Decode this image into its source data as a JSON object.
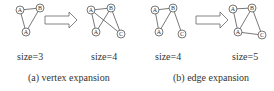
{
  "panels": [
    {
      "caption": "(a) vertex expansion",
      "before": {
        "size_label": "size=3",
        "nodes": [
          {
            "id": "a1",
            "label": "A",
            "x": 20,
            "y": 10
          },
          {
            "id": "b1",
            "label": "B",
            "x": 40,
            "y": 8
          },
          {
            "id": "a2",
            "label": "A",
            "x": 26,
            "y": 32
          }
        ],
        "edges": [
          [
            "a1",
            "b1"
          ],
          [
            "a1",
            "a2"
          ],
          [
            "b1",
            "a2"
          ]
        ]
      },
      "after": {
        "size_label": "size=4",
        "nodes": [
          {
            "id": "a1",
            "label": "A",
            "x": 91,
            "y": 10
          },
          {
            "id": "b1",
            "label": "B",
            "x": 111,
            "y": 8
          },
          {
            "id": "a2",
            "label": "A",
            "x": 96,
            "y": 32
          },
          {
            "id": "c1",
            "label": "C",
            "x": 121,
            "y": 34
          }
        ],
        "edges": [
          [
            "a1",
            "b1"
          ],
          [
            "a1",
            "a2"
          ],
          [
            "b1",
            "a2"
          ],
          [
            "a1",
            "c1"
          ],
          [
            "b1",
            "c1"
          ]
        ]
      },
      "arrow": {
        "x": 45,
        "y": 12
      }
    },
    {
      "caption": "(b) edge expansion",
      "before": {
        "size_label": "size=4",
        "nodes": [
          {
            "id": "a1",
            "label": "A",
            "x": 155,
            "y": 10
          },
          {
            "id": "b1",
            "label": "B",
            "x": 173,
            "y": 8
          },
          {
            "id": "a2",
            "label": "A",
            "x": 159,
            "y": 32
          },
          {
            "id": "c1",
            "label": "C",
            "x": 182,
            "y": 34
          }
        ],
        "edges": [
          [
            "a1",
            "b1"
          ],
          [
            "a1",
            "a2"
          ],
          [
            "b1",
            "a2"
          ],
          [
            "b1",
            "c1"
          ]
        ]
      },
      "after": {
        "size_label": "size=5",
        "nodes": [
          {
            "id": "a1",
            "label": "A",
            "x": 233,
            "y": 9
          },
          {
            "id": "b1",
            "label": "B",
            "x": 252,
            "y": 8
          },
          {
            "id": "a2",
            "label": "A",
            "x": 238,
            "y": 32
          },
          {
            "id": "c1",
            "label": "C",
            "x": 262,
            "y": 35
          }
        ],
        "edges": [
          [
            "a1",
            "b1"
          ],
          [
            "a1",
            "a2"
          ],
          [
            "b1",
            "a2"
          ],
          [
            "b1",
            "c1"
          ],
          [
            "a2",
            "c1"
          ]
        ]
      },
      "arrow": {
        "x": 196,
        "y": 12
      }
    }
  ]
}
